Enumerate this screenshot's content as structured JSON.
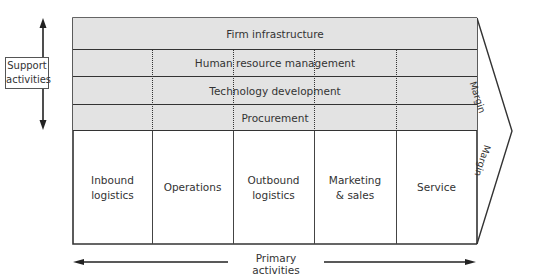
{
  "diagram": {
    "support_activities": {
      "label": "Support\nactivities",
      "rows": [
        {
          "label": "Firm infrastructure"
        },
        {
          "label": "Human resource management"
        },
        {
          "label": "Technology development"
        },
        {
          "label": "Procurement"
        }
      ],
      "fill_color": "#e3e3e3"
    },
    "primary_activities": {
      "label": "Primary activities",
      "columns": [
        {
          "label": "Inbound\nlogistics"
        },
        {
          "label": "Operations"
        },
        {
          "label": "Outbound\nlogistics"
        },
        {
          "label": "Marketing\n& sales"
        },
        {
          "label": "Service"
        }
      ]
    },
    "margin": {
      "upper_label": "Margin",
      "lower_label": "Margin"
    },
    "line_color": "#333333"
  }
}
